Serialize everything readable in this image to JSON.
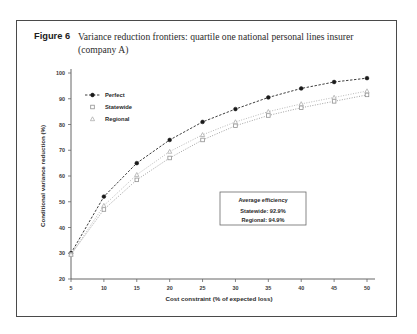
{
  "page": {
    "top_text_fragment": ""
  },
  "figure": {
    "label": "Figure 6",
    "caption": "Variance reduction frontiers: quartile one national personal lines insurer (company A)"
  },
  "annotation": {
    "title": "Average efficiency",
    "line1": "Statewide:  92.9%",
    "line2": "Regional:  94.9%"
  },
  "colors": {
    "frame": "#4a4a4a",
    "perfect": "#1a1a1a",
    "statewide": "#8a8a8a",
    "regional": "#a8a8a8",
    "text": "#2b2b2b"
  },
  "chart_data": {
    "type": "line",
    "title": "",
    "xlabel": "Cost constraint (% of expected loss)",
    "ylabel": "Conditional variance reduction (%)",
    "x": [
      5,
      10,
      15,
      20,
      25,
      30,
      35,
      40,
      45,
      50
    ],
    "xlim": [
      5,
      50
    ],
    "ylim": [
      20,
      100
    ],
    "xticks": [
      5,
      10,
      15,
      20,
      25,
      30,
      35,
      40,
      45,
      50
    ],
    "yticks": [
      20,
      30,
      40,
      50,
      60,
      70,
      80,
      90,
      100
    ],
    "grid": false,
    "legend_position": "upper-left",
    "series": [
      {
        "name": "Perfect",
        "marker": "filled-circle",
        "line_style": "dashed",
        "values": [
          30,
          52,
          65,
          74,
          81,
          86,
          90.5,
          94,
          96.5,
          98
        ]
      },
      {
        "name": "Statewide",
        "marker": "open-square",
        "line_style": "dotted",
        "values": [
          29.5,
          47,
          58.5,
          67,
          74,
          79.5,
          83.5,
          86.5,
          89,
          91.5
        ]
      },
      {
        "name": "Regional",
        "marker": "open-triangle",
        "line_style": "dotted",
        "values": [
          29.5,
          48.5,
          60.5,
          69.5,
          76,
          81,
          85,
          88,
          90.5,
          93
        ]
      }
    ]
  }
}
